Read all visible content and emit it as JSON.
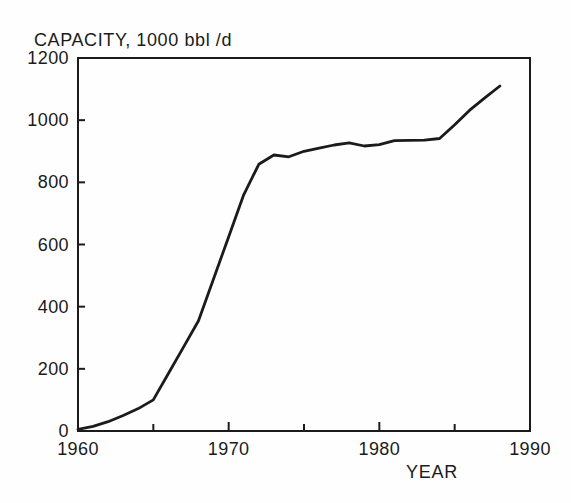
{
  "page": {
    "background": "#fefefe",
    "ink": "#1b1b1b"
  },
  "chart_data": {
    "type": "line",
    "title": "CAPACITY, 1000 bbl /d",
    "xlabel": "YEAR",
    "ylabel": "CAPACITY, 1000 bbl /d",
    "xlim": [
      1960,
      1990
    ],
    "ylim": [
      0,
      1200
    ],
    "x_major_ticks": [
      1960,
      1970,
      1980,
      1990
    ],
    "x_minor_ticks": [
      1965,
      1975,
      1985
    ],
    "y_ticks": [
      0,
      200,
      400,
      600,
      800,
      1000,
      1200
    ],
    "grid": false,
    "legend": "none",
    "line_color": "#1b1b1b",
    "series": [
      {
        "x": [
          1960,
          1961,
          1962,
          1963,
          1964,
          1965,
          1966,
          1967,
          1968,
          1969,
          1970,
          1971,
          1972,
          1973,
          1974,
          1975,
          1976,
          1977,
          1978,
          1979,
          1980,
          1981,
          1982,
          1983,
          1984,
          1985,
          1986,
          1987,
          1988
        ],
        "y": [
          5,
          15,
          30,
          50,
          72,
          100,
          185,
          270,
          355,
          490,
          625,
          760,
          858,
          888,
          882,
          900,
          910,
          920,
          927,
          917,
          921,
          934,
          935,
          936,
          941,
          985,
          1032,
          1072,
          1110
        ]
      }
    ]
  }
}
